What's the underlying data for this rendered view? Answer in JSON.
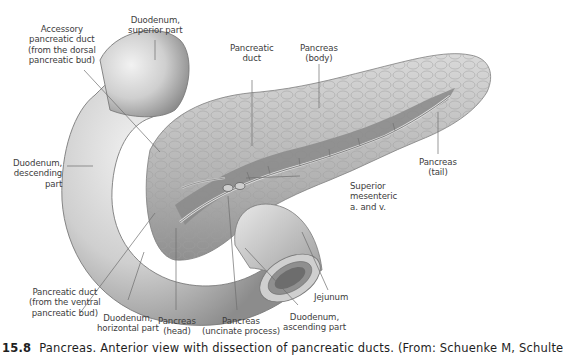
{
  "figure": {
    "labels": {
      "accessory_duct": [
        "Accessory",
        "pancreatic duct",
        "(from the dorsal",
        "pancreatic bud)"
      ],
      "duodenum_superior": [
        "Duodenum,",
        "superior part"
      ],
      "pancreatic_duct": [
        "Pancreatic",
        "duct"
      ],
      "pancreas_body": [
        "Pancreas",
        "(body)"
      ],
      "pancreas_tail": [
        "Pancreas",
        "(tail)"
      ],
      "duodenum_descending": [
        "Duodenum,",
        "descending",
        "part"
      ],
      "superior_mesenteric": [
        "Superior",
        "mesenteric",
        "a. and v."
      ],
      "pancreatic_duct_ventral": [
        "Pancreatic duct",
        "(from the ventral",
        "pancreatic bud)"
      ],
      "duodenum_horizontal": [
        "Duodenum,",
        "horizontal part"
      ],
      "pancreas_head": [
        "Pancreas",
        "(head)"
      ],
      "pancreas_uncinate": [
        "Pancreas",
        "(uncinate process)"
      ],
      "duodenum_ascending": [
        "Duodenum,",
        "ascending part"
      ],
      "jejunum": [
        "Jejunum"
      ]
    },
    "caption": {
      "number": "15.8",
      "text": "Pancreas. Anterior view with dissection of pancreatic ducts. (From: Schuenke M, Schulte"
    },
    "colors": {
      "organ_light": "#e6e6e6",
      "organ_mid": "#bdbdbd",
      "organ_dark": "#8a8a8a",
      "duct_channel": "#7a7a7a",
      "leader_line": "#6e6e6e",
      "label_text": "#3c3c3c"
    }
  }
}
